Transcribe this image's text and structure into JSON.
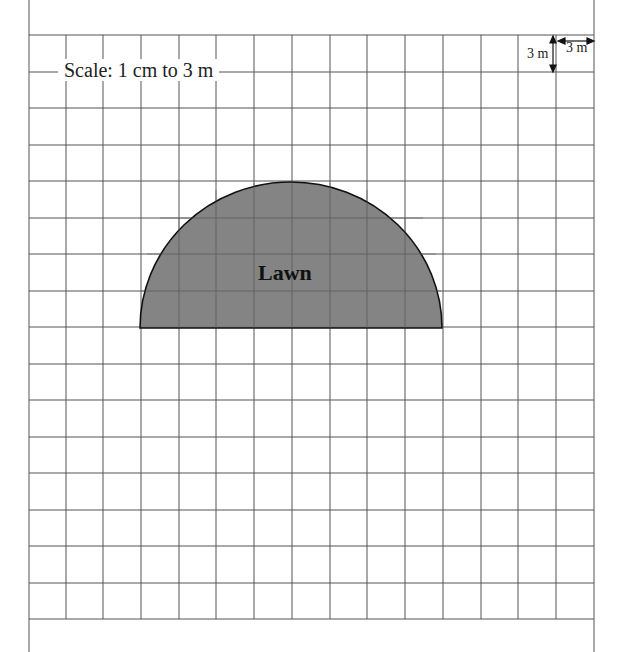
{
  "diagram": {
    "scale_label": "Scale: 1 cm to 3 m",
    "shape_label": "Lawn",
    "shape": "semicircle",
    "shape_fill": "#7a7a7a",
    "grid": {
      "columns": 15,
      "rows": 16,
      "cell_meaning": "1 cm = 3 m"
    },
    "legend": {
      "vertical": "3 m",
      "horizontal": "3 m"
    }
  }
}
